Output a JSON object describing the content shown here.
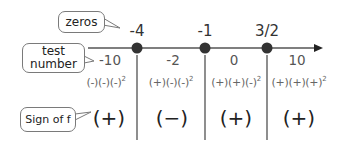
{
  "colors": {
    "axis": "#555555",
    "dot": "#333333",
    "divider": "#444444",
    "callout_border": "#7a7a7a"
  },
  "callouts": {
    "zeros": "zeros",
    "test_number_line1": "test",
    "test_number_line2": "number",
    "sign_of_f": "Sign of f"
  },
  "number_line": {
    "arrow": "right",
    "zeros": [
      {
        "label": "-4",
        "x": 137
      },
      {
        "label": "-1",
        "x": 205
      },
      {
        "label": "3/2",
        "x": 267
      }
    ]
  },
  "intervals": [
    {
      "test_number": "-10",
      "factors": [
        "(-)",
        "(-)",
        "(-)"
      ],
      "exponent": "2",
      "sign": "(+)",
      "center_x": 98
    },
    {
      "test_number": "-2",
      "factors": [
        "(+)",
        "(-)",
        "(-)"
      ],
      "exponent": "2",
      "sign": "(−)",
      "center_x": 171
    },
    {
      "test_number": "0",
      "factors": [
        "(+)",
        "(+)",
        "(-)"
      ],
      "exponent": "2",
      "sign": "(+)",
      "center_x": 236
    },
    {
      "test_number": "10",
      "factors": [
        "(+)",
        "(+)",
        "(+)"
      ],
      "exponent": "2",
      "sign": "(+)",
      "center_x": 298
    }
  ],
  "factor_strings": [
    "(-)(-)(-)",
    "(+)(-)(-)",
    "(+)(+)(-)",
    "(+)(+)(+)"
  ]
}
